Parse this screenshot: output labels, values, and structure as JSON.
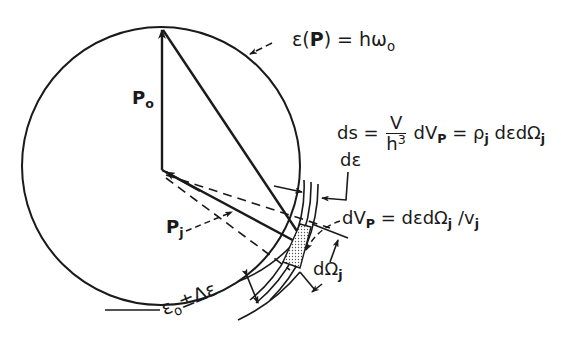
{
  "diagram": {
    "stroke_color": "#1a1a1a",
    "dot_fill_color": "#8a8a8a",
    "background": "#ffffff",
    "labels": {
      "energy_surface": {
        "eps": "ε",
        "paren_open": "(",
        "p": "P",
        "paren_close": ")",
        "eq": " = hω",
        "sub": "o"
      },
      "p0": {
        "p": "P",
        "sub": "o"
      },
      "pj": {
        "p": "P",
        "sub": "j"
      },
      "ds_formula": {
        "lhs": "ds = ",
        "num": "V",
        "den_h": "h",
        "den_exp": "3",
        "mid1": " dV",
        "sub_p": "P",
        "mid2": " = ρ",
        "sub_j": "j",
        "rest": " dεdΩ",
        "sub_j2": "j"
      },
      "d_eps": {
        "d": "d",
        "eps": "ε"
      },
      "dVp_formula": {
        "lhs": "dV",
        "sub_p": "P",
        "mid": " = dεdΩ",
        "sub_j": "j",
        "slash": " /v",
        "sub_j2": "j"
      },
      "d_omega": {
        "d": "dΩ",
        "sub": "j"
      },
      "shell_label": {
        "eps": "ε",
        "sub": "o",
        "pm": "±",
        "delta": "Δε"
      }
    }
  }
}
